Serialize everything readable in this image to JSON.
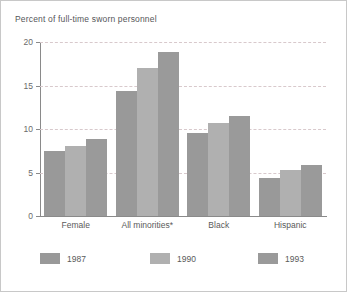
{
  "chart_data": {
    "type": "bar",
    "title": "Percent of full-time sworn personnel",
    "xlabel": "",
    "ylabel": "",
    "ylim": [
      0,
      20
    ],
    "yticks": [
      0,
      5,
      10,
      15,
      20
    ],
    "ytick_labels": [
      "0",
      "5",
      "10",
      "15",
      "20"
    ],
    "grid": true,
    "legend_position": "bottom",
    "categories": [
      "Female",
      "All minorities*",
      "Black",
      "Hispanic"
    ],
    "series": [
      {
        "name": "1987",
        "color": "#999999",
        "values": [
          7.5,
          14.4,
          9.5,
          4.4
        ]
      },
      {
        "name": "1990",
        "color": "#b0b0b0",
        "values": [
          8.1,
          17.0,
          10.7,
          5.3
        ]
      },
      {
        "name": "1993",
        "color": "#9a9a9a",
        "values": [
          8.9,
          18.8,
          11.5,
          5.9
        ]
      }
    ],
    "footnote": "*"
  },
  "legend": {
    "items": [
      {
        "label": "1987"
      },
      {
        "label": "1990"
      },
      {
        "label": "1993"
      }
    ]
  }
}
